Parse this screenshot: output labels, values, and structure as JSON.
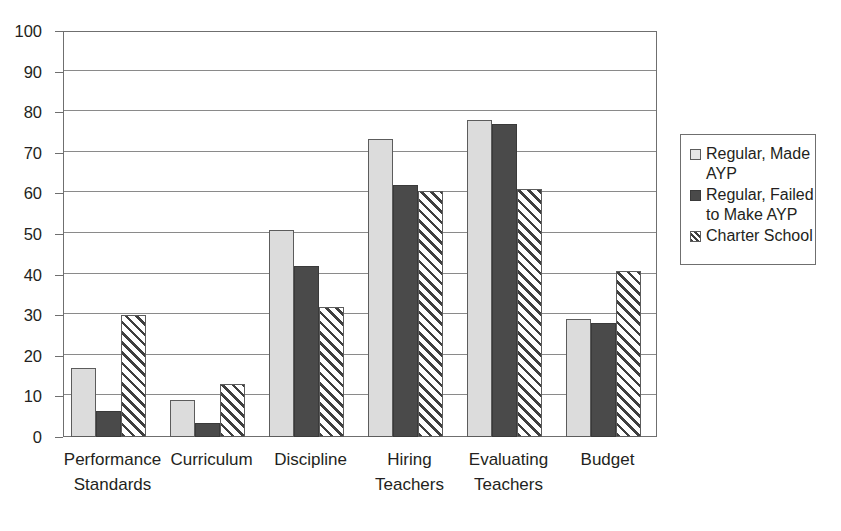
{
  "chart_data": {
    "type": "bar",
    "title": "",
    "xlabel": "",
    "ylabel": "",
    "ylim": [
      0,
      100
    ],
    "yticks": [
      0,
      10,
      20,
      30,
      40,
      50,
      60,
      70,
      80,
      90,
      100
    ],
    "grid": true,
    "legend_position": "right",
    "categories": [
      "Performance Standards",
      "Curriculum",
      "Discipline",
      "Hiring Teachers",
      "Evaluating Teachers",
      "Budget"
    ],
    "category_lines": [
      [
        "Performance",
        "Standards"
      ],
      [
        "Curriculum"
      ],
      [
        "Discipline"
      ],
      [
        "Hiring",
        "Teachers"
      ],
      [
        "Evaluating",
        "Teachers"
      ],
      [
        "Budget"
      ]
    ],
    "series": [
      {
        "name": "Regular, Made AYP",
        "color": "#dcdcdc",
        "values": [
          17,
          9,
          51,
          73.5,
          78,
          29
        ]
      },
      {
        "name": "Regular, Failed to Make AYP",
        "color": "#4a4a4a",
        "values": [
          6.5,
          3.5,
          42,
          62,
          77,
          28
        ]
      },
      {
        "name": "Charter School",
        "color": "#ffffff",
        "values": [
          30,
          13,
          32,
          60.5,
          61,
          41
        ]
      }
    ]
  },
  "legend": {
    "items": [
      {
        "label": "Regular, Made AYP"
      },
      {
        "label": "Regular, Failed to Make AYP"
      },
      {
        "label": "Charter School"
      }
    ]
  }
}
